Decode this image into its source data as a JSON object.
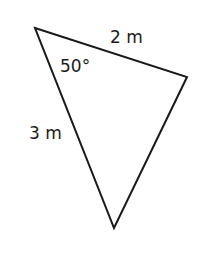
{
  "diagram": {
    "type": "triangle",
    "vertices": {
      "top_left": [
        35,
        28
      ],
      "right": [
        187,
        77
      ],
      "bottom": [
        114,
        228
      ]
    },
    "labels": {
      "side_top": "2 m",
      "angle_top_left": "50°",
      "side_left": "3 m"
    },
    "stroke_color": "#1a1a1a"
  }
}
